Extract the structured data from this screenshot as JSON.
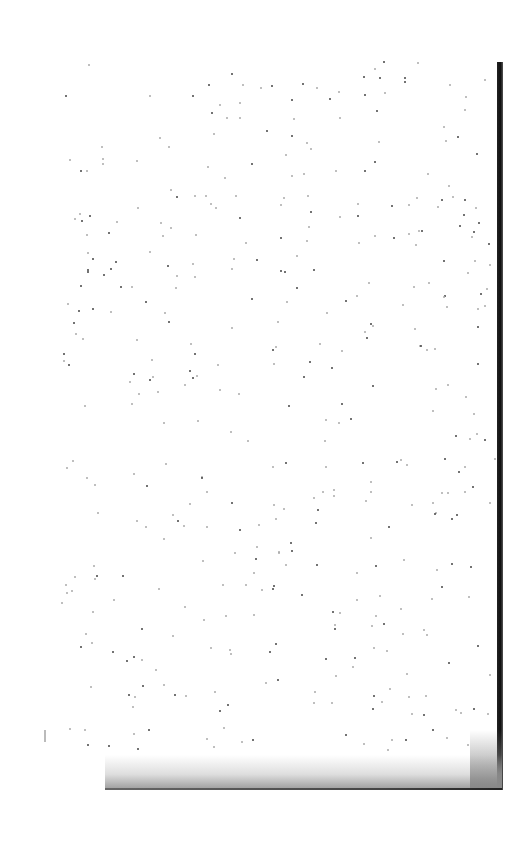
{
  "document": {
    "type": "scanned-blank-page",
    "text": ""
  }
}
